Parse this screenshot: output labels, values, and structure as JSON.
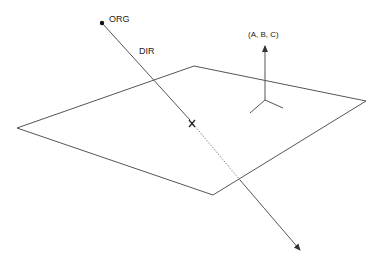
{
  "diagram": {
    "labels": {
      "origin": "ORG",
      "direction": "DIR",
      "normal": "(A, B, C)",
      "intersection": "X"
    },
    "colors": {
      "line": "#555555",
      "text": "#222222",
      "background": "#ffffff"
    },
    "plane_vertices": [
      [
        17,
        128
      ],
      [
        194,
        66
      ],
      [
        366,
        101
      ],
      [
        213,
        195
      ]
    ],
    "ray": {
      "origin": [
        102,
        23
      ],
      "intersection": [
        192,
        123
      ],
      "plane_exit": [
        240,
        180
      ],
      "tip": [
        301,
        251
      ]
    },
    "normal_vector": {
      "base": [
        265,
        100
      ],
      "tip": [
        265,
        45
      ]
    }
  }
}
